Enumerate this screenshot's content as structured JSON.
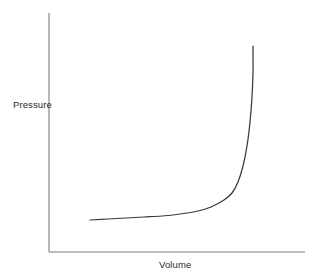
{
  "chart_data": {
    "type": "line",
    "title": "",
    "subtitle": "",
    "xlabel": "Volume",
    "ylabel": "Pressure",
    "legend": [],
    "annotations": [],
    "grid": false,
    "xticks": [],
    "yticks": [],
    "xlim": [
      0,
      1
    ],
    "ylim": [
      0,
      1
    ],
    "axis_color": "#7f7f7f",
    "curve_color": "#3a3a3a",
    "background": "#ffffff",
    "series": [
      {
        "name": "Pressure vs Volume",
        "color": "#3a3a3a",
        "x": [
          0.16,
          0.23,
          0.3,
          0.37,
          0.44,
          0.51,
          0.58,
          0.63,
          0.68,
          0.71,
          0.735,
          0.755,
          0.77,
          0.783,
          0.793,
          0.8,
          0.806,
          0.812
        ],
        "y": [
          0.133,
          0.137,
          0.142,
          0.148,
          0.155,
          0.164,
          0.178,
          0.192,
          0.218,
          0.245,
          0.285,
          0.345,
          0.42,
          0.51,
          0.605,
          0.7,
          0.79,
          0.865
        ]
      }
    ],
    "curve_points_px": [
      [
        90,
        220
      ],
      [
        108,
        219
      ],
      [
        126,
        218
      ],
      [
        144,
        217
      ],
      [
        162,
        216
      ],
      [
        180,
        214
      ],
      [
        198,
        211
      ],
      [
        211,
        207
      ],
      [
        224,
        200
      ],
      [
        232,
        193
      ],
      [
        238,
        182
      ],
      [
        243,
        166
      ],
      [
        247,
        146
      ],
      [
        250,
        122
      ],
      [
        252,
        97
      ],
      [
        253,
        72
      ],
      [
        253,
        56
      ],
      [
        253,
        46
      ]
    ],
    "axes_px": {
      "y_axis": {
        "x": 49,
        "y_top": 13,
        "y_bottom": 252
      },
      "x_axis": {
        "y": 252,
        "x_left": 49,
        "x_right": 305
      }
    }
  },
  "labels": {
    "y_axis_label": "Pressure",
    "x_axis_label": "Volume"
  }
}
